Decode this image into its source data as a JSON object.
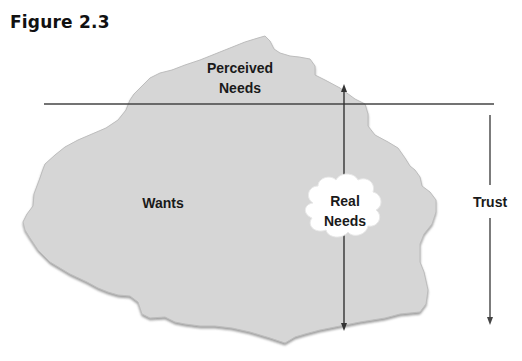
{
  "figure": {
    "title": "Figure 2.3"
  },
  "diagram": {
    "labels": {
      "perceived_needs_line1": "Perceived",
      "perceived_needs_line2": "Needs",
      "wants": "Wants",
      "real_needs_line1": "Real",
      "real_needs_line2": "Needs",
      "trust": "Trust"
    },
    "colors": {
      "iceberg_fill": "#d6d6d6",
      "iceberg_edge": "#9a9a9a",
      "line": "#444444",
      "cloud_fill": "#ffffff"
    }
  }
}
